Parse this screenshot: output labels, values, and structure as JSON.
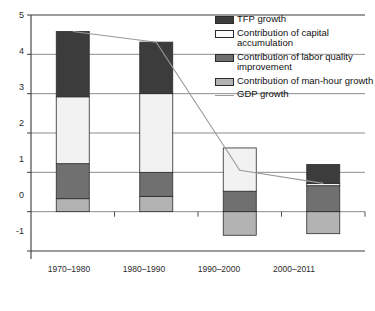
{
  "chart_data": {
    "type": "bar",
    "subtype": "stacked-bar-with-line",
    "title": "",
    "xlabel": "",
    "ylabel": "",
    "categories": [
      "1970–1980",
      "1980–1990",
      "1990–2000",
      "2000–2011"
    ],
    "ylim": [
      -1,
      5
    ],
    "yticks": [
      -1,
      0,
      1,
      2,
      3,
      4,
      5
    ],
    "ytick_labels": [
      "-1",
      "0",
      "1",
      "2",
      "3",
      "4",
      "5"
    ],
    "grid": true,
    "legend_position": "top-right",
    "stack_order_bottom_to_top": [
      "Contribution of man-hour growth",
      "Contribution of labor quality improvement",
      "Contribution of capital accumulation",
      "TFP growth"
    ],
    "series": [
      {
        "name": "Contribution of man-hour growth",
        "color": "#b3b3b3",
        "values": [
          0.33,
          0.39,
          -0.6,
          -0.56
        ]
      },
      {
        "name": "Contribution of labor quality improvement",
        "color": "#707070",
        "values": [
          0.89,
          0.61,
          0.52,
          0.66
        ]
      },
      {
        "name": "Contribution of capital accumulation",
        "color": "#f2f2f2",
        "values": [
          1.7,
          2.0,
          1.1,
          0.06
        ]
      },
      {
        "name": "TFP growth",
        "color": "#3c3c3c",
        "values": [
          1.66,
          1.31,
          0.0,
          0.48
        ]
      }
    ],
    "line_series": {
      "name": "GDP growth",
      "color": "#9a9a9a",
      "values": [
        4.58,
        4.31,
        1.05,
        0.72
      ]
    },
    "bar_tops": [
      4.58,
      4.31,
      1.62,
      1.2
    ],
    "bar_bottoms": [
      0,
      0,
      -0.6,
      -0.56
    ]
  },
  "legend": {
    "items": [
      {
        "label": "TFP growth",
        "swatch": "dark-swatch",
        "kind": "fill"
      },
      {
        "label": "Contribution of capital accumulation",
        "swatch": "white-swatch",
        "kind": "fill"
      },
      {
        "label": "Contribution of labor quality improvement",
        "swatch": "medium-gray-swatch",
        "kind": "fill"
      },
      {
        "label": "Contribution of man-hour growth",
        "swatch": "light-gray-swatch",
        "kind": "fill"
      },
      {
        "label": "GDP growth",
        "swatch": "line-swatch",
        "kind": "line"
      }
    ]
  },
  "colors": {
    "tfp": "#3c3c3c",
    "capital": "#f2f2f2",
    "labor": "#707070",
    "manhour": "#b3b3b3",
    "gdp_line": "#9a9a9a",
    "axis": "#3a3a3a",
    "grid": "#6f6f6f"
  }
}
